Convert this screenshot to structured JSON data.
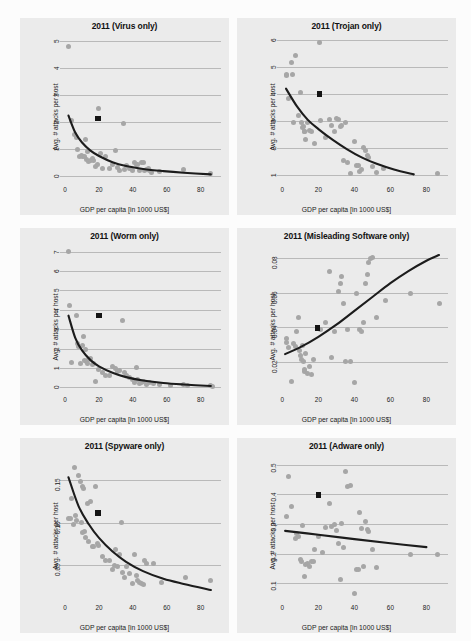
{
  "figure": {
    "name": "malware-attacks-vs-gdp-2011",
    "panel_count": 6,
    "marker_legend": {
      "scatter_point": "country observation",
      "square_marker": "highlighted country"
    },
    "colors": {
      "panel_background": "#ebebeb",
      "gridline": "#b9b9b9",
      "scatter": "#a6a6a6",
      "fit_curve": "#1c1c1c",
      "square_marker": "#141414"
    }
  },
  "chart_data": [
    {
      "type": "scatter",
      "title": "2011 (Virus only)",
      "xlabel": "GDP per capita [in 1000 US$]",
      "ylabel": "Avg. # attacks per host",
      "xlim": [
        -3,
        92
      ],
      "ylim": [
        -0.25,
        5.2
      ],
      "xticks": [
        0,
        20,
        40,
        60,
        80
      ],
      "yticks": [
        0,
        1,
        2,
        3,
        4,
        5
      ],
      "grid": true,
      "legend": "none",
      "x": [
        2.2,
        3.5,
        5.5,
        6.5,
        7.5,
        8.5,
        9.5,
        10.5,
        11.5,
        12.0,
        12.5,
        13.5,
        14.0,
        15.0,
        16.0,
        17.0,
        18.0,
        19.0,
        20.0,
        21.0,
        22.0,
        24.0,
        26.0,
        28.0,
        30.0,
        31.0,
        32.0,
        34.5,
        35.0,
        36.0,
        38.0,
        40.0,
        41.0,
        42.0,
        43.0,
        44.0,
        45.0,
        46.0,
        47.0,
        48.0,
        49.0,
        50.0,
        51.0,
        56.0,
        70.0,
        86.0
      ],
      "y": [
        4.82,
        2.05,
        1.55,
        1.45,
        1.0,
        0.75,
        0.78,
        0.75,
        0.72,
        1.35,
        0.62,
        0.9,
        0.55,
        0.6,
        0.65,
        0.6,
        0.38,
        0.42,
        2.5,
        0.85,
        0.3,
        0.75,
        0.3,
        0.45,
        0.95,
        0.32,
        0.2,
        1.95,
        0.25,
        0.4,
        0.3,
        0.22,
        0.5,
        0.45,
        0.42,
        0.22,
        0.5,
        0.5,
        0.2,
        0.25,
        0.3,
        0.2,
        0.15,
        0.18,
        0.25,
        0.12
      ],
      "highlight_point": {
        "x": 19.5,
        "y": 2.15
      },
      "fit_curve": {
        "form": "power-decay",
        "points": [
          [
            2.0,
            2.25
          ],
          [
            6,
            1.62
          ],
          [
            10,
            1.25
          ],
          [
            15,
            0.95
          ],
          [
            20,
            0.75
          ],
          [
            28,
            0.52
          ],
          [
            36,
            0.38
          ],
          [
            46,
            0.27
          ],
          [
            58,
            0.19
          ],
          [
            70,
            0.13
          ],
          [
            86,
            0.07
          ]
        ]
      }
    },
    {
      "type": "scatter",
      "title": "2011 (Trojan only)",
      "xlabel": "GDP per capita [in 1000 US$]",
      "ylabel": "Avg. # attacks per host",
      "xlim": [
        -3,
        92
      ],
      "ylim": [
        0.7,
        6.15
      ],
      "xticks": [
        0,
        20,
        40,
        60,
        80
      ],
      "yticks": [
        1,
        2,
        3,
        4,
        5,
        6
      ],
      "grid": true,
      "legend": "none",
      "x": [
        2.0,
        2.5,
        3.5,
        5.0,
        5.5,
        6.0,
        7.5,
        9.0,
        10.0,
        10.5,
        11.0,
        11.5,
        12.0,
        12.5,
        13.0,
        14.0,
        15.0,
        16.0,
        18.0,
        20.5,
        21.0,
        24.0,
        26.0,
        27.0,
        29.0,
        30.0,
        31.0,
        32.0,
        33.0,
        34.0,
        35.0,
        36.0,
        38.0,
        40.0,
        41.0,
        42.0,
        43.0,
        44.0,
        45.0,
        46.0,
        47.0,
        48.0,
        50.0,
        52.0,
        56.0,
        86.0
      ],
      "y": [
        4.72,
        4.68,
        3.85,
        5.18,
        4.72,
        2.95,
        5.42,
        3.2,
        4.05,
        2.95,
        2.75,
        2.8,
        2.62,
        2.6,
        2.3,
        2.95,
        2.65,
        2.6,
        2.15,
        5.9,
        3.0,
        2.4,
        3.05,
        2.85,
        2.6,
        3.1,
        3.05,
        2.78,
        2.85,
        1.55,
        2.95,
        1.45,
        1.05,
        2.25,
        1.35,
        1.35,
        1.12,
        1.2,
        2.0,
        1.9,
        1.72,
        1.65,
        1.32,
        1.1,
        1.25,
        1.05
      ],
      "highlight_point": {
        "x": 20.5,
        "y": 4.0
      },
      "fit_curve": {
        "form": "decay",
        "points": [
          [
            2.0,
            4.2
          ],
          [
            8,
            3.55
          ],
          [
            14,
            3.05
          ],
          [
            20,
            2.7
          ],
          [
            28,
            2.3
          ],
          [
            36,
            1.95
          ],
          [
            44,
            1.65
          ],
          [
            52,
            1.42
          ],
          [
            62,
            1.2
          ],
          [
            73,
            1.02
          ]
        ]
      }
    },
    {
      "type": "scatter",
      "title": "2011 (Worm only)",
      "xlabel": "GDP per capita [in 1000 US$]",
      "ylabel": "Avg. # attacks per host",
      "xlim": [
        -3,
        92
      ],
      "ylim": [
        -0.3,
        7.3
      ],
      "xticks": [
        0,
        20,
        40,
        60,
        80
      ],
      "yticks": [
        0,
        1,
        2,
        3,
        4,
        5,
        6,
        7
      ],
      "grid": true,
      "legend": "none",
      "x": [
        2.0,
        2.5,
        4.0,
        6.5,
        7.5,
        8.0,
        9.0,
        10.0,
        11.0,
        11.5,
        12.0,
        12.5,
        13.0,
        14.0,
        15.0,
        16.0,
        17.0,
        18.0,
        20.0,
        22.0,
        24.0,
        26.0,
        28.0,
        30.0,
        31.0,
        32.0,
        34.0,
        35.0,
        36.0,
        38.0,
        40.0,
        41.0,
        42.0,
        43.0,
        44.0,
        45.0,
        46.0,
        48.0,
        50.0,
        52.0,
        56.0,
        62.0,
        70.0,
        72.0,
        86.0,
        87.0
      ],
      "y": [
        7.0,
        4.2,
        1.3,
        3.7,
        2.25,
        2.1,
        1.25,
        2.15,
        2.6,
        1.4,
        1.95,
        1.35,
        1.2,
        1.45,
        1.5,
        1.18,
        1.25,
        0.3,
        0.92,
        0.75,
        0.58,
        0.6,
        1.05,
        0.95,
        0.82,
        0.85,
        3.45,
        0.75,
        0.58,
        0.5,
        0.42,
        0.22,
        1.0,
        0.38,
        0.2,
        0.25,
        0.28,
        0.12,
        0.22,
        0.18,
        0.12,
        0.1,
        0.12,
        0.08,
        0.08,
        0.05
      ],
      "highlight_point": {
        "x": 20.0,
        "y": 3.7
      },
      "fit_curve": {
        "form": "power-decay",
        "points": [
          [
            2.0,
            3.7
          ],
          [
            6,
            2.55
          ],
          [
            10,
            1.9
          ],
          [
            15,
            1.4
          ],
          [
            20,
            1.08
          ],
          [
            28,
            0.75
          ],
          [
            36,
            0.52
          ],
          [
            46,
            0.35
          ],
          [
            58,
            0.22
          ],
          [
            70,
            0.14
          ],
          [
            86,
            0.06
          ]
        ]
      }
    },
    {
      "type": "scatter",
      "title": "2011 (Misleading Software only)",
      "xlabel": "GDP per capita [in 1000 US$]",
      "ylabel": "Avg. # attacks per host",
      "xlim": [
        -3,
        92
      ],
      "ylim": [
        0.002,
        0.087
      ],
      "xticks": [
        0,
        20,
        40,
        60,
        80
      ],
      "yticks": [
        0.02,
        0.04,
        0.06,
        0.08
      ],
      "ytick_labels": [
        "0.02",
        "0.04",
        "0.06",
        "0.08"
      ],
      "grid": true,
      "legend": "none",
      "x": [
        2.0,
        2.5,
        3.5,
        5.0,
        6.0,
        7.5,
        8.0,
        9.0,
        9.5,
        10.0,
        10.5,
        11.0,
        11.5,
        12.0,
        12.5,
        13.0,
        14.0,
        15.0,
        16.0,
        17.0,
        19.5,
        21.0,
        24.0,
        26.0,
        27.0,
        29.0,
        31.0,
        32.0,
        33.0,
        34.0,
        35.0,
        36.0,
        38.0,
        40.0,
        41.0,
        43.0,
        44.0,
        45.0,
        46.0,
        47.0,
        48.0,
        49.0,
        50.0,
        52.0,
        57.0,
        71.0,
        87.0
      ],
      "y": [
        0.0335,
        0.031,
        0.0285,
        0.0085,
        0.0305,
        0.029,
        0.0375,
        0.0455,
        0.0265,
        0.0235,
        0.0215,
        0.0295,
        0.0205,
        0.0155,
        0.0145,
        0.025,
        0.0135,
        0.0175,
        0.0125,
        0.0215,
        0.0395,
        0.0385,
        0.0425,
        0.0725,
        0.0225,
        0.0375,
        0.0605,
        0.0655,
        0.0695,
        0.054,
        0.0205,
        0.0385,
        0.0205,
        0.008,
        0.0595,
        0.0385,
        0.0375,
        0.0425,
        0.0655,
        0.0705,
        0.0775,
        0.0795,
        0.0805,
        0.0455,
        0.0555,
        0.0595,
        0.0535
      ],
      "highlight_point": {
        "x": 19.5,
        "y": 0.0395
      },
      "fit_curve": {
        "form": "convex-increase",
        "points": [
          [
            1.5,
            0.0245
          ],
          [
            10,
            0.0285
          ],
          [
            20,
            0.0345
          ],
          [
            30,
            0.0415
          ],
          [
            40,
            0.0495
          ],
          [
            50,
            0.0575
          ],
          [
            60,
            0.0655
          ],
          [
            70,
            0.0725
          ],
          [
            80,
            0.0785
          ],
          [
            87,
            0.0818
          ]
        ]
      }
    },
    {
      "type": "scatter",
      "title": "2011 (Spyware only)",
      "xlabel": "GDP per capita [in 1000 US$]",
      "ylabel": "Avg. # attacks per host",
      "xlim": [
        -3,
        92
      ],
      "ylim": [
        0.008,
        0.178
      ],
      "xticks": [
        0,
        20,
        40,
        60,
        80
      ],
      "yticks": [
        0.05,
        0.1,
        0.15
      ],
      "ytick_labels": [
        "0.05",
        "0.10",
        "0.15"
      ],
      "grid": true,
      "legend": "none",
      "x": [
        2.0,
        3.0,
        4.0,
        5.0,
        5.5,
        6.0,
        7.0,
        8.0,
        9.0,
        9.5,
        10.0,
        10.5,
        11.0,
        11.5,
        12.0,
        13.0,
        14.0,
        15.0,
        16.0,
        17.0,
        18.0,
        19.0,
        20.0,
        22.0,
        24.0,
        26.0,
        28.0,
        29.0,
        30.0,
        31.0,
        32.0,
        33.0,
        34.0,
        35.0,
        36.0,
        38.0,
        40.0,
        41.0,
        42.0,
        43.0,
        44.0,
        45.0,
        46.0,
        47.0,
        48.0,
        52.0,
        57.0,
        71.0,
        86.0
      ],
      "y": [
        0.105,
        0.105,
        0.128,
        0.098,
        0.165,
        0.108,
        0.102,
        0.155,
        0.148,
        0.1,
        0.088,
        0.142,
        0.14,
        0.09,
        0.083,
        0.122,
        0.078,
        0.125,
        0.072,
        0.072,
        0.142,
        0.075,
        0.073,
        0.06,
        0.055,
        0.055,
        0.045,
        0.05,
        0.068,
        0.048,
        0.062,
        0.1,
        0.042,
        0.035,
        0.048,
        0.04,
        0.028,
        0.062,
        0.038,
        0.032,
        0.03,
        0.028,
        0.027,
        0.055,
        0.052,
        0.052,
        0.03,
        0.035,
        0.032
      ],
      "highlight_point": {
        "x": 19.5,
        "y": 0.111
      },
      "fit_curve": {
        "form": "power-decay",
        "points": [
          [
            2.0,
            0.153
          ],
          [
            8,
            0.119
          ],
          [
            14,
            0.098
          ],
          [
            20,
            0.082
          ],
          [
            28,
            0.066
          ],
          [
            36,
            0.054
          ],
          [
            46,
            0.043
          ],
          [
            58,
            0.034
          ],
          [
            70,
            0.028
          ],
          [
            86,
            0.021
          ]
        ]
      }
    },
    {
      "type": "scatter",
      "title": "2011 (Adware only)",
      "xlabel": "GDP per capita [in 1000 US$]",
      "ylabel": "Avg. # attacks per host",
      "xlim": [
        -3,
        92
      ],
      "ylim": [
        0.04,
        0.53
      ],
      "xticks": [
        0,
        20,
        40,
        60,
        80
      ],
      "yticks": [
        0.1,
        0.2,
        0.3,
        0.4,
        0.5
      ],
      "ytick_labels": [
        "0.1",
        "0.2",
        "0.3",
        "0.4",
        "0.5"
      ],
      "grid": true,
      "legend": "none",
      "x": [
        2.0,
        3.5,
        5.0,
        7.0,
        8.0,
        9.0,
        10.0,
        10.5,
        11.0,
        12.0,
        13.0,
        14.0,
        15.0,
        16.0,
        17.0,
        18.0,
        20.0,
        22.0,
        24.0,
        26.0,
        27.0,
        29.0,
        30.0,
        31.0,
        32.0,
        33.0,
        34.0,
        35.0,
        36.0,
        38.0,
        40.0,
        41.0,
        42.0,
        43.0,
        44.0,
        45.0,
        46.0,
        47.0,
        48.0,
        50.0,
        52.0,
        71.0,
        86.0
      ],
      "y": [
        0.325,
        0.462,
        0.358,
        0.252,
        0.268,
        0.258,
        0.18,
        0.175,
        0.295,
        0.122,
        0.165,
        0.168,
        0.158,
        0.175,
        0.172,
        0.215,
        0.258,
        0.205,
        0.288,
        0.368,
        0.292,
        0.298,
        0.278,
        0.235,
        0.112,
        0.302,
        0.22,
        0.478,
        0.428,
        0.43,
        0.065,
        0.148,
        0.148,
        0.338,
        0.285,
        0.155,
        0.308,
        0.282,
        0.275,
        0.215,
        0.152,
        0.198,
        0.198
      ],
      "highlight_point": {
        "x": 20.0,
        "y": 0.398
      },
      "fit_curve": {
        "form": "linear-decrease",
        "points": [
          [
            1.5,
            0.277
          ],
          [
            20,
            0.264
          ],
          [
            40,
            0.249
          ],
          [
            60,
            0.235
          ],
          [
            80,
            0.222
          ]
        ]
      }
    }
  ]
}
